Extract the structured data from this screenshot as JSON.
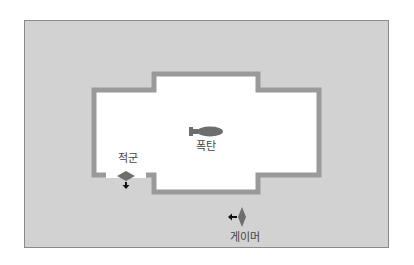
{
  "diagram": {
    "type": "room-layout",
    "colors": {
      "outer_area": "#d2d2d2",
      "outer_border": "#8a8a8a",
      "room_floor": "#ffffff",
      "wall": "#9a9a9a",
      "icon": "#6e6e6e",
      "arrow": "#111111"
    },
    "markers": [
      {
        "id": "bomb",
        "label": "폭탄",
        "icon": "bomb-icon"
      },
      {
        "id": "enemy",
        "label": "적군",
        "icon": "enemy-marker-icon",
        "direction": "down"
      },
      {
        "id": "gamer",
        "label": "게이머",
        "icon": "player-marker-icon",
        "direction": "left"
      }
    ]
  }
}
